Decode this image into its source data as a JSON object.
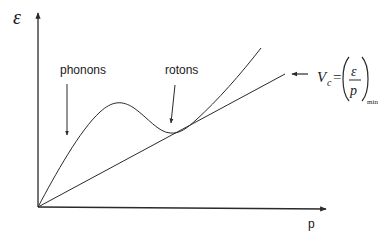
{
  "diagram": {
    "type": "dispersion-curve",
    "y_axis_label": "ε",
    "x_axis_label": "p",
    "annotations": {
      "phonons": "phonons",
      "rotons": "rotons"
    },
    "formula": {
      "lhs_symbol": "V",
      "lhs_subscript": "c",
      "equals": "=",
      "numerator": "ε",
      "denominator": "p",
      "subscript": "min",
      "description": "Landau critical velocity"
    },
    "curves": [
      {
        "name": "dispersion-curve",
        "description": "excitation energy ε(p): linear phonon region, maximum, roton minimum, then rising"
      },
      {
        "name": "tangent-line",
        "description": "line from origin tangent to the roton minimum"
      }
    ]
  }
}
